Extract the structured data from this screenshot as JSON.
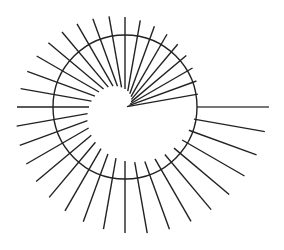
{
  "diagram": {
    "type": "spiral-rays",
    "width": 284,
    "height": 250,
    "center": {
      "x": 125,
      "y": 107
    },
    "circle": {
      "radius": 72,
      "stroke": "#222222",
      "stroke_width": 1.4
    },
    "rays": {
      "count": 36,
      "angle_step_deg": 10,
      "start_angle_deg": 10,
      "inner_radius_start": 0,
      "inner_radius_end": 72,
      "outer_radius_start": 72,
      "outer_radius_end": 144,
      "stroke": "#222222",
      "stroke_width": 1.4,
      "last_ray_stroke": "#777777",
      "last_ray_stroke_width": 2
    },
    "background": "#ffffff"
  }
}
